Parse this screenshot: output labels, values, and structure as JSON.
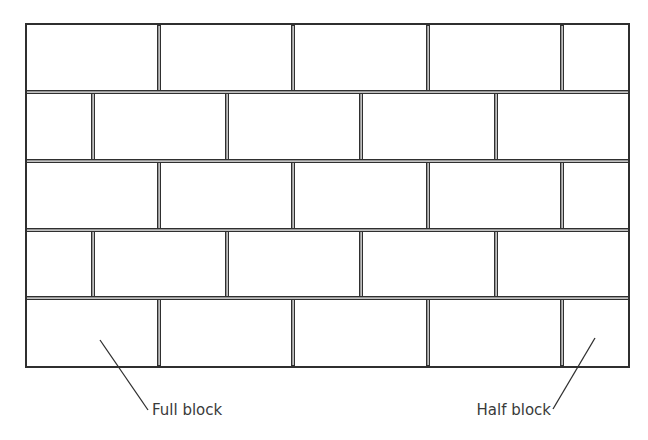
{
  "diagram": {
    "colors": {
      "line": "#2f2f2f",
      "background": "#ffffff",
      "text": "#3a3a3a"
    },
    "wall": {
      "x": 26,
      "y": 24,
      "width": 603,
      "height": 343,
      "rows": [
        {
          "y_top": 24,
          "y_bottom": 92,
          "joints_x": [
            159,
            293,
            428,
            562
          ],
          "bricks": [
            "full",
            "full",
            "full",
            "full",
            "half"
          ]
        },
        {
          "y_top": 92,
          "y_bottom": 161,
          "joints_x": [
            93,
            227,
            361,
            496
          ],
          "bricks": [
            "half",
            "full",
            "full",
            "full",
            "full"
          ]
        },
        {
          "y_top": 161,
          "y_bottom": 230,
          "joints_x": [
            159,
            293,
            428,
            562
          ],
          "bricks": [
            "full",
            "full",
            "full",
            "full",
            "half"
          ]
        },
        {
          "y_top": 230,
          "y_bottom": 298,
          "joints_x": [
            93,
            227,
            361,
            496
          ],
          "bricks": [
            "half",
            "full",
            "full",
            "full",
            "full"
          ]
        },
        {
          "y_top": 298,
          "y_bottom": 367,
          "joints_x": [
            159,
            293,
            428,
            562
          ],
          "bricks": [
            "full",
            "full",
            "full",
            "full",
            "half"
          ]
        }
      ]
    },
    "labels": [
      {
        "id": "full-block",
        "text": "Full block",
        "text_x": 152,
        "text_y": 415,
        "anchor": "start",
        "leader": {
          "x1": 100,
          "y1": 340,
          "x2": 148,
          "y2": 410
        }
      },
      {
        "id": "half-block",
        "text": "Half block",
        "text_x": 551,
        "text_y": 415,
        "anchor": "end",
        "leader": {
          "x1": 595,
          "y1": 338,
          "x2": 553,
          "y2": 409
        }
      }
    ]
  }
}
